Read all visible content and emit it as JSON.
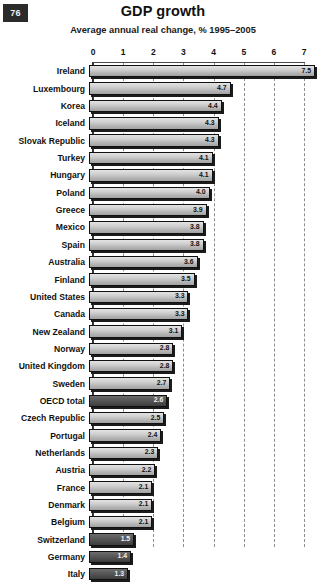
{
  "page": {
    "number": "76"
  },
  "header": {
    "title": "GDP growth",
    "subtitle": "Average annual real change, % 1995–2005"
  },
  "chart_data": {
    "type": "bar",
    "orientation": "horizontal",
    "title": "GDP growth",
    "subtitle": "Average annual real change, % 1995–2005",
    "xlabel": "",
    "ylabel": "",
    "xlim": [
      0,
      7.6
    ],
    "xticks": [
      "0",
      "1",
      "2",
      "3",
      "4",
      "5",
      "6",
      "7"
    ],
    "grid": "vertical-dashed",
    "legend": "none",
    "highlight_color": "#4a4a4a",
    "bar_color": "#c4c4c4",
    "categories": [
      "Ireland",
      "Luxembourg",
      "Korea",
      "Iceland",
      "Slovak Republic",
      "Turkey",
      "Hungary",
      "Poland",
      "Greece",
      "Mexico",
      "Spain",
      "Australia",
      "Finland",
      "United States",
      "Canada",
      "New Zealand",
      "Norway",
      "United Kingdom",
      "Sweden",
      "OECD total",
      "Czech Republic",
      "Portugal",
      "Netherlands",
      "Austria",
      "France",
      "Denmark",
      "Belgium",
      "Switzerland",
      "Germany",
      "Italy"
    ],
    "values": [
      7.5,
      4.7,
      4.4,
      4.3,
      4.3,
      4.1,
      4.1,
      4.0,
      3.9,
      3.8,
      3.8,
      3.6,
      3.5,
      3.3,
      3.3,
      3.1,
      2.8,
      2.8,
      2.7,
      2.6,
      2.5,
      2.4,
      2.3,
      2.2,
      2.1,
      2.1,
      2.1,
      1.5,
      1.4,
      1.3
    ],
    "value_labels": [
      "7.5",
      "4.7",
      "4.4",
      "4.3",
      "4.3",
      "4.1",
      "4.1",
      "4.0",
      "3.9",
      "3.8",
      "3.8",
      "3.6",
      "3.5",
      "3.3",
      "3.3",
      "3.1",
      "2.8",
      "2.8",
      "2.7",
      "2.6",
      "2.5",
      "2.4",
      "2.3",
      "2.2",
      "2.1",
      "2.1",
      "2.1",
      "1.5",
      "1.4",
      "1.3"
    ],
    "highlighted": [
      false,
      false,
      false,
      false,
      false,
      false,
      false,
      false,
      false,
      false,
      false,
      false,
      false,
      false,
      false,
      false,
      false,
      false,
      false,
      true,
      false,
      false,
      false,
      false,
      false,
      false,
      false,
      true,
      true,
      true
    ]
  }
}
